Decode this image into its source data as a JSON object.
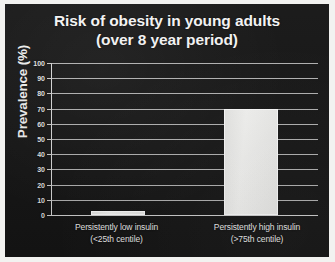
{
  "chart_data": {
    "type": "bar",
    "title": "Risk of obesity in young adults",
    "subtitle": "(over 8 year period)",
    "xlabel": "",
    "ylabel": "Prevalence (%)",
    "ylim": [
      0,
      100
    ],
    "ytick_step": 10,
    "yticks": [
      100,
      90,
      80,
      70,
      60,
      50,
      40,
      30,
      20,
      10,
      0
    ],
    "grid": true,
    "legend": false,
    "categories": [
      "Persistently low insulin",
      "Persistently high insulin"
    ],
    "category_sublabels": [
      "(<25th centile)",
      "(>75th centile)"
    ],
    "values": [
      2.5,
      70
    ],
    "colors": {
      "background": "#151515",
      "bar_fill": "#f1f1ef",
      "bar_border": "#ffffff",
      "gridline": "#cfcfcf",
      "text": "#f0f0f0",
      "page_border": "#f2f2f0"
    }
  }
}
